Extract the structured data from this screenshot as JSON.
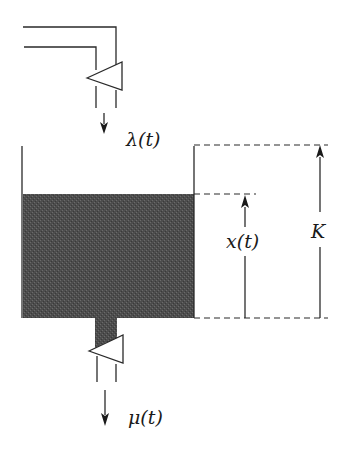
{
  "diagram": {
    "colors": {
      "line": "#2a2a2a",
      "liquid": "#4a4a4a",
      "background": "#ffffff"
    },
    "labels": {
      "inflow": "λ(t)",
      "outflow": "μ(t)",
      "level": "x(t)",
      "capacity": "K"
    },
    "components": [
      {
        "id": "inlet-pipe",
        "kind": "pipe"
      },
      {
        "id": "inlet-valve",
        "kind": "valve"
      },
      {
        "id": "tank",
        "kind": "tank"
      },
      {
        "id": "liquid",
        "kind": "fill"
      },
      {
        "id": "outlet-pipe",
        "kind": "pipe"
      },
      {
        "id": "outlet-valve",
        "kind": "valve"
      },
      {
        "id": "level-arrow",
        "kind": "dimension",
        "label": "x(t)"
      },
      {
        "id": "capacity-arrow",
        "kind": "dimension",
        "label": "K"
      }
    ]
  }
}
